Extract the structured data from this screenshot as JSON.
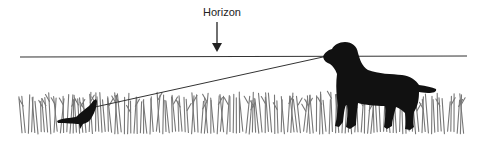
{
  "diagram": {
    "horizon_label": "Horizon",
    "elements": [
      {
        "id": "horizon-line",
        "type": "line",
        "from": [
          20,
          57
        ],
        "to": [
          467,
          56
        ]
      },
      {
        "id": "horizon-arrow",
        "type": "arrow",
        "from": [
          217,
          22
        ],
        "to": [
          217,
          50
        ]
      },
      {
        "id": "line-of-sight",
        "type": "line",
        "from": [
          323,
          57
        ],
        "to": [
          95,
          108
        ]
      },
      {
        "id": "dog",
        "type": "silhouette",
        "position": [
          320,
          42
        ]
      },
      {
        "id": "bird",
        "type": "silhouette",
        "position": [
          58,
          100
        ]
      },
      {
        "id": "grass",
        "type": "texture",
        "x_range": [
          20,
          465
        ],
        "y_range": [
          92,
          133
        ]
      }
    ]
  },
  "colors": {
    "line": "#333333",
    "silhouette": "#111111",
    "grass": "#777777",
    "background": "#ffffff"
  }
}
